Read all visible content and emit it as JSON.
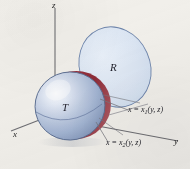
{
  "figure": {
    "kind": "3d-solid-projection-diagram",
    "background_color": "#f3f1ec",
    "axes": {
      "z_label": "z",
      "x_label": "x",
      "y_label": "y",
      "axis_color": "#6f6f74"
    },
    "solid": {
      "label": "T",
      "shape": "ellipsoid",
      "body_fill_light": "#eef2f9",
      "body_fill_mid": "#b9c6de",
      "body_fill_dark": "#8ea2c4",
      "outline_color": "#5d6f92",
      "cap_color": "#9c3442",
      "cap_highlight": "#c96a73"
    },
    "projection_region": {
      "label": "R",
      "shape": "ellipse",
      "fill_color": "#dce6f3",
      "outline_color": "#6f86ad"
    },
    "surface_labels": {
      "upper": {
        "lhs": "x",
        "eq": "=",
        "fn": "x",
        "sub": "1",
        "args": "(y, z)",
        "full": "x = x1(y, z)"
      },
      "lower": {
        "lhs": "x",
        "eq": "=",
        "fn": "x",
        "sub": "2",
        "args": "(y, z)",
        "full": "x = x2(y, z)"
      }
    },
    "leader_lines_color": "#77777d",
    "projection_guide_color": "#8a8a92"
  }
}
